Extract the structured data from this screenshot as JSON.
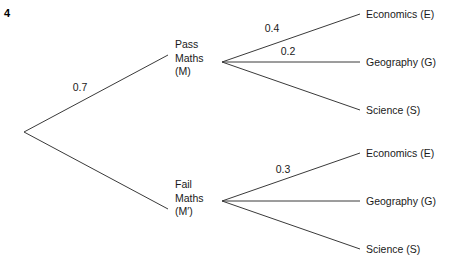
{
  "question": {
    "number": "4"
  },
  "diagram": {
    "type": "probability-tree",
    "root": {
      "x": 24,
      "y": 132
    },
    "stage1": [
      {
        "id": "pass-maths",
        "lines": [
          "Pass",
          "Maths",
          "(M)"
        ],
        "text_x": 175,
        "text_top": 38,
        "node_x": 222,
        "node_y": 62,
        "line_end_x": 168,
        "line_end_y": 55,
        "probability": "0.7",
        "prob_x": 80,
        "prob_y": 87
      },
      {
        "id": "fail-maths",
        "lines": [
          "Fail",
          "Maths",
          "(M′)"
        ],
        "text_x": 175,
        "text_top": 178,
        "node_x": 222,
        "node_y": 201,
        "line_end_x": 168,
        "line_end_y": 209,
        "probability": "",
        "prob_x": 0,
        "prob_y": 0
      }
    ],
    "stage2": [
      {
        "parent": "pass-maths",
        "branches": [
          {
            "label": "Economics (E)",
            "label_x": 366,
            "label_y": 14,
            "line_end_x": 360,
            "line_end_y": 14,
            "probability": "0.4",
            "prob_x": 272,
            "prob_y": 28
          },
          {
            "label": "Geography (G)",
            "label_x": 366,
            "label_y": 62,
            "line_end_x": 360,
            "line_end_y": 62,
            "probability": "0.2",
            "prob_x": 288,
            "prob_y": 51
          },
          {
            "label": "Science (S)",
            "label_x": 366,
            "label_y": 110,
            "line_end_x": 360,
            "line_end_y": 110,
            "probability": "",
            "prob_x": 0,
            "prob_y": 0
          }
        ]
      },
      {
        "parent": "fail-maths",
        "branches": [
          {
            "label": "Economics (E)",
            "label_x": 366,
            "label_y": 153,
            "line_end_x": 360,
            "line_end_y": 153,
            "probability": "0.3",
            "prob_x": 283,
            "prob_y": 169
          },
          {
            "label": "Geography (G)",
            "label_x": 366,
            "label_y": 201,
            "line_end_x": 360,
            "line_end_y": 201,
            "probability": "",
            "prob_x": 0,
            "prob_y": 0
          },
          {
            "label": "Science (S)",
            "label_x": 366,
            "label_y": 249,
            "line_end_x": 360,
            "line_end_y": 249,
            "probability": "",
            "prob_x": 0,
            "prob_y": 0
          }
        ]
      }
    ],
    "style": {
      "line_color": "#3a3a3a",
      "line_width": 1,
      "background": "#ffffff"
    }
  }
}
